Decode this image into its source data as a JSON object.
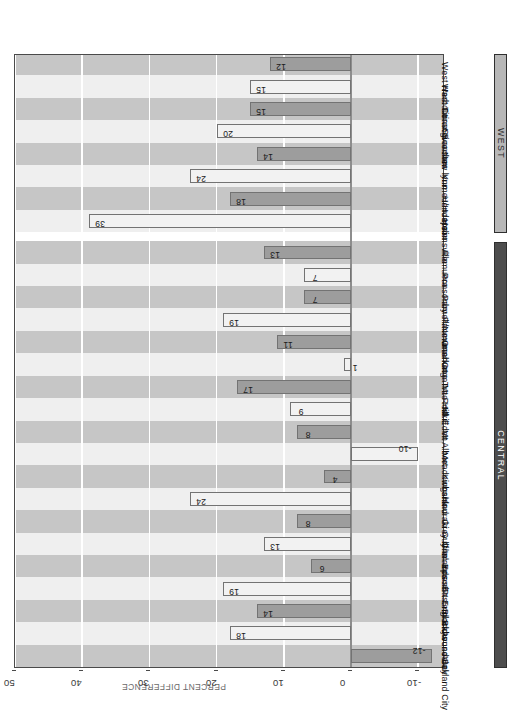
{
  "chart_data": {
    "type": "bar",
    "orientation": "vertical-rendered-rotated",
    "title": "",
    "xlabel": "",
    "ylabel": "PERCENT DIFFERENCE",
    "ylim": [
      -14,
      50
    ],
    "yticks": [
      -10,
      0,
      10,
      20,
      30,
      40,
      50
    ],
    "grid": true,
    "legend": "none",
    "categories": [
      "Auckland City",
      "Avondale",
      "Blockhouse Bay",
      "Eastern Bays",
      "Epsom",
      "Glen Innes/Pt England",
      "Grey lynn",
      "Hauraki Gulf Islands",
      "Kingsland",
      "Meadowbank",
      "Mt Albert",
      "Mt Eden",
      "Mt Roskill",
      "One Tree Hill",
      "Onehunga",
      "Panmure",
      "Parnell/Newmarket",
      "Ponsonby",
      "Remuera",
      "Helensville",
      "Henderson",
      "Kumeu/Huapai",
      "New lynn",
      "Swanson",
      "Titirangi",
      "West Coast Beaches",
      "West Harbour"
    ],
    "values": [
      -12,
      18,
      14,
      19,
      6,
      13,
      8,
      24,
      4,
      -10,
      8,
      9,
      17,
      1,
      11,
      19,
      7,
      7,
      13,
      39,
      18,
      24,
      14,
      20,
      15,
      15,
      12
    ],
    "bar_styles": [
      "dark",
      "light",
      "dark",
      "light",
      "dark",
      "light",
      "dark",
      "light",
      "dark",
      "light",
      "dark",
      "light",
      "dark",
      "light",
      "dark",
      "light",
      "dark",
      "light",
      "dark",
      "light",
      "dark",
      "light",
      "dark",
      "light",
      "dark",
      "light",
      "dark"
    ],
    "groups": [
      {
        "label": "CENTRAL",
        "start": 0,
        "end": 18
      },
      {
        "label": "WEST",
        "start": 19,
        "end": 26
      }
    ],
    "colors": {
      "bar_dark": "#9d9d9d",
      "bar_light": "#f2f2f2",
      "bar_border": "#737373",
      "band_dark": "#c6c6c6",
      "band_light": "#efefef",
      "gridline": "#ffffff",
      "zero_line": "#8d8d8d",
      "region_central": "#4d4d4d",
      "region_west": "#b7b7b7",
      "axis": "#4a4a4a"
    }
  }
}
